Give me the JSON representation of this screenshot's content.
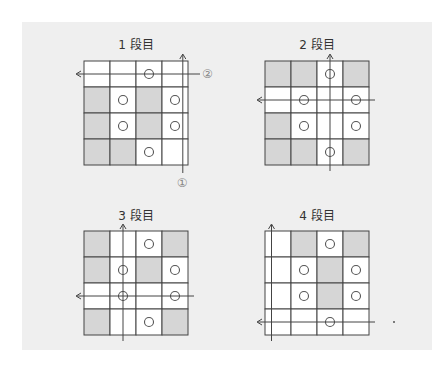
{
  "figure": {
    "colors": {
      "panel_bg": "#efefef",
      "cell_white": "#ffffff",
      "cell_gray": "#d6d6d6",
      "grid_line": "#444444",
      "circle_stroke": "#555555",
      "label_color": "#888888"
    },
    "blocks": [
      {
        "title": "1 段目",
        "left": 84,
        "top": 61,
        "title_top": 35,
        "cells": [
          [
            "w",
            "w",
            "wo",
            "w"
          ],
          [
            "g",
            "wo",
            "g",
            "wo"
          ],
          [
            "g",
            "wo",
            "g",
            "wo"
          ],
          [
            "g",
            "g",
            "wo",
            "w"
          ]
        ],
        "vline_col": 3,
        "vline_offset": 0.3,
        "hline_row": 0,
        "hline_offset": 0,
        "vlabel": "①",
        "hlabel": "②"
      },
      {
        "title": "2 段目",
        "left": 265,
        "top": 61,
        "title_top": 35,
        "cells": [
          [
            "g",
            "g",
            "wo",
            "g"
          ],
          [
            "w",
            "wo",
            "w",
            "wo"
          ],
          [
            "g",
            "wo",
            "w",
            "wo"
          ],
          [
            "g",
            "g",
            "wo",
            "g"
          ]
        ],
        "vline_col": 2,
        "vline_offset": 0,
        "hline_row": 1,
        "hline_offset": 0,
        "vlabel": "",
        "hlabel": ""
      },
      {
        "title": "3 段目",
        "left": 84,
        "top": 231,
        "title_top": 206,
        "cells": [
          [
            "g",
            "w",
            "wo",
            "g"
          ],
          [
            "g",
            "wo",
            "g",
            "wo"
          ],
          [
            "w",
            "wo",
            "w",
            "wo"
          ],
          [
            "g",
            "w",
            "wo",
            "g"
          ]
        ],
        "vline_col": 1,
        "vline_offset": 0,
        "hline_row": 2,
        "hline_offset": 0,
        "vlabel": "",
        "hlabel": ""
      },
      {
        "title": "4 段目",
        "left": 265,
        "top": 231,
        "title_top": 206,
        "cells": [
          [
            "w",
            "g",
            "wo",
            "g"
          ],
          [
            "w",
            "wo",
            "g",
            "wo"
          ],
          [
            "w",
            "wo",
            "g",
            "wo"
          ],
          [
            "w",
            "w",
            "wo",
            "w"
          ]
        ],
        "vline_col": 0,
        "vline_offset": -0.25,
        "hline_row": 3,
        "hline_offset": 0,
        "vlabel": "",
        "hlabel": ""
      }
    ]
  }
}
